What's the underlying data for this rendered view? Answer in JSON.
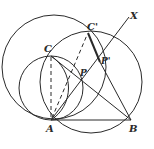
{
  "diagram": {
    "type": "geometry-construction",
    "labels": {
      "A": "A",
      "B": "B",
      "C": "C",
      "C_prime": "C'",
      "P": "P",
      "P_prime": "P'",
      "X": "X"
    },
    "points": {
      "A": [
        51,
        120
      ],
      "B": [
        131,
        120
      ],
      "C": [
        51,
        56
      ],
      "C_prime": [
        88,
        33
      ],
      "P": [
        82,
        80
      ],
      "P_prime": [
        100,
        62
      ],
      "X_end": [
        129,
        17
      ]
    },
    "circles": [
      {
        "name": "big-left-circle",
        "center": [
          54,
          67
        ],
        "r": 52
      },
      {
        "name": "circle-ABCC'",
        "center": [
          91,
          82
        ],
        "r": 52
      },
      {
        "name": "small-circle-ACP",
        "center": [
          51,
          88
        ],
        "r": 32
      },
      {
        "name": "circle-ACP'",
        "center": [
          72,
          88
        ],
        "r": 38
      }
    ],
    "segments": [
      {
        "name": "AB",
        "style": "solid"
      },
      {
        "name": "AX ray",
        "style": "solid"
      },
      {
        "name": "CB",
        "style": "solid"
      },
      {
        "name": "C'B",
        "style": "solid",
        "thick_part": "C'P'"
      },
      {
        "name": "CA",
        "style": "dashed"
      },
      {
        "name": "AC'",
        "style": "dashed"
      }
    ],
    "colors": {
      "stroke": "#2a2a2a",
      "background": "#ffffff"
    }
  }
}
